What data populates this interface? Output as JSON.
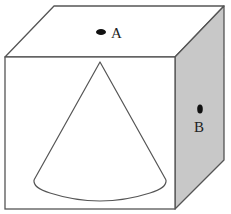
{
  "diagram": {
    "colors": {
      "background": "#ffffff",
      "stroke": "#555555",
      "right_face": "#c8c8c8",
      "top_face": "#ffffff",
      "front_face": "#ffffff",
      "point": "#111111"
    },
    "cube": {
      "front_face": {
        "x": 5,
        "y": 57,
        "width": 170,
        "height": 152
      },
      "depth_offset": {
        "dx": 49,
        "dy": -51
      }
    },
    "cone": {
      "apex": [
        100,
        62
      ],
      "base_left": [
        34,
        180
      ],
      "base_right": [
        166,
        180
      ],
      "base_bottom_y": 200
    },
    "points": [
      {
        "id": "A",
        "label": "A",
        "face": "top",
        "dot": [
          101,
          32
        ],
        "label_pos": [
          111,
          38
        ]
      },
      {
        "id": "B",
        "label": "B",
        "face": "right",
        "dot": [
          200,
          108
        ],
        "label_pos": [
          194,
          132
        ]
      }
    ]
  }
}
